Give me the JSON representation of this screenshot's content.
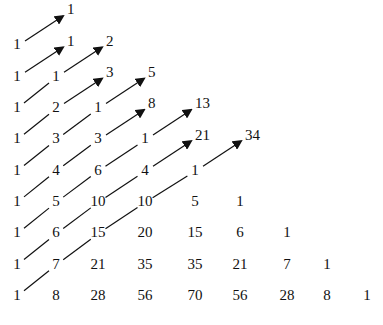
{
  "rows": [
    [
      1
    ],
    [
      1,
      1
    ],
    [
      1,
      2,
      1
    ],
    [
      1,
      3,
      3,
      1
    ],
    [
      1,
      4,
      6,
      4,
      1
    ],
    [
      1,
      5,
      10,
      10,
      5,
      1
    ],
    [
      1,
      6,
      15,
      20,
      15,
      6,
      1
    ],
    [
      1,
      7,
      21,
      35,
      35,
      21,
      7,
      1
    ],
    [
      1,
      8,
      28,
      56,
      70,
      56,
      28,
      8,
      1
    ]
  ],
  "diagonal_sums": [
    "1",
    "1",
    "2",
    "3",
    "5",
    "8",
    "13",
    "21",
    "34"
  ]
}
